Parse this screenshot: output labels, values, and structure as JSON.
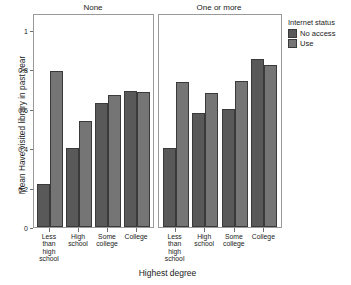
{
  "chart_data": {
    "type": "bar",
    "title": "",
    "xlabel": "Highest degree",
    "ylabel": "Mean Have visited library in past year",
    "ylim": [
      0,
      1
    ],
    "yticks": [
      0,
      0.2,
      0.4,
      0.6,
      0.8,
      1
    ],
    "ytick_labels": [
      "0",
      "0.2",
      "0.4",
      "0.6",
      "0.8",
      "1"
    ],
    "grid": false,
    "legend_position": "right",
    "legend_title": "Internet status",
    "categories": [
      "Less than high school",
      "High school",
      "Some college",
      "College"
    ],
    "category_labels": [
      [
        "Less",
        "than",
        "high",
        "school"
      ],
      [
        "High",
        "school"
      ],
      [
        "Some",
        "college"
      ],
      [
        "College"
      ]
    ],
    "facets": [
      {
        "label": "None",
        "series": [
          {
            "name": "No access",
            "color": "#595959",
            "values": [
              0.22,
              0.4,
              0.63,
              0.69
            ]
          },
          {
            "name": "Use",
            "color": "#757575",
            "values": [
              0.79,
              0.54,
              0.67,
              0.685
            ]
          }
        ]
      },
      {
        "label": "One or more",
        "series": [
          {
            "name": "No access",
            "color": "#595959",
            "values": [
              0.4,
              0.58,
              0.6,
              0.855
            ]
          },
          {
            "name": "Use",
            "color": "#757575",
            "values": [
              0.735,
              0.68,
              0.74,
              0.82
            ]
          }
        ]
      }
    ],
    "legend_entries": [
      {
        "name": "No access",
        "color": "#595959"
      },
      {
        "name": "Use",
        "color": "#757575"
      }
    ]
  }
}
